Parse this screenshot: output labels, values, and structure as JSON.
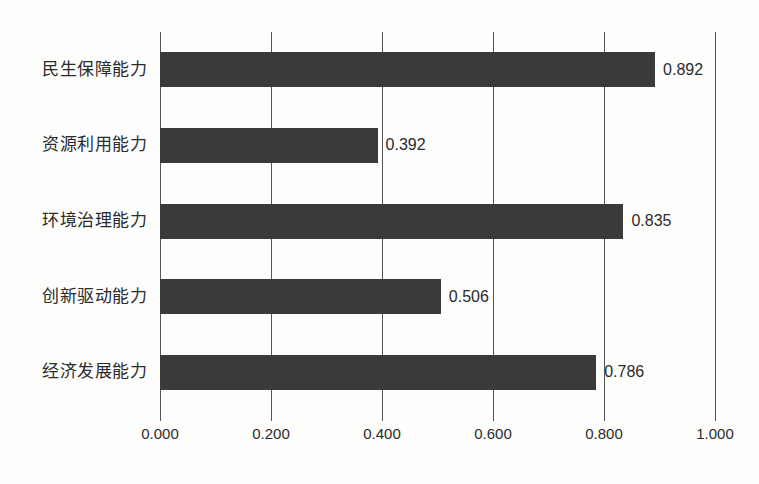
{
  "chart_data": {
    "type": "bar",
    "orientation": "horizontal",
    "title": "",
    "xlabel": "",
    "ylabel": "",
    "xlim": [
      0.0,
      1.0
    ],
    "xticks": [
      "0.000",
      "0.200",
      "0.400",
      "0.600",
      "0.800",
      "1.000"
    ],
    "xtick_values": [
      0.0,
      0.2,
      0.4,
      0.6,
      0.8,
      1.0
    ],
    "grid": "vertical",
    "legend": "none",
    "bar_color": "#3a3a3a",
    "categories": [
      "民生保障能力",
      "资源利用能力",
      "环境治理能力",
      "创新驱动能力",
      "经济发展能力"
    ],
    "values": [
      0.892,
      0.392,
      0.835,
      0.506,
      0.786
    ],
    "value_labels": [
      "0.892",
      "0.392",
      "0.835",
      "0.506",
      "0.786"
    ],
    "bars": [
      {
        "category": "民生保障能力",
        "value": 0.892,
        "label": "0.892"
      },
      {
        "category": "资源利用能力",
        "value": 0.392,
        "label": "0.392"
      },
      {
        "category": "环境治理能力",
        "value": 0.835,
        "label": "0.835"
      },
      {
        "category": "创新驱动能力",
        "value": 0.506,
        "label": "0.506"
      },
      {
        "category": "经济发展能力",
        "value": 0.786,
        "label": "0.786"
      }
    ]
  }
}
